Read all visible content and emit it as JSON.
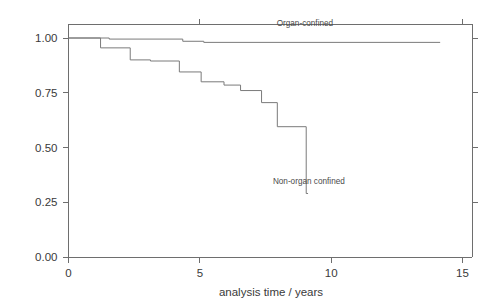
{
  "chart_data": {
    "type": "line",
    "subtype": "kaplan-meier-step",
    "title": "",
    "xlabel": "analysis time / years",
    "ylabel": "",
    "xlim": [
      -0.35,
      15.6
    ],
    "ylim": [
      -0.06,
      1.09
    ],
    "grid": false,
    "legend_position": "inline-annotation",
    "xticks": [
      0,
      5,
      10,
      15
    ],
    "xticklabels": [
      "0",
      "5",
      "10",
      "15"
    ],
    "yticks": [
      0.0,
      0.25,
      0.5,
      0.75,
      1.0
    ],
    "yticklabels": [
      "0.00",
      "0.25",
      "0.50",
      "0.75",
      "1.00"
    ],
    "series": [
      {
        "name": "Organ-confined",
        "label": "Organ-confined",
        "label_x": 9.0,
        "label_y": 1.055,
        "x": [
          0.0,
          1.55,
          1.55,
          4.35,
          4.35,
          5.15,
          5.15,
          14.15
        ],
        "y": [
          1.0,
          1.0,
          0.995,
          0.995,
          0.985,
          0.985,
          0.98,
          0.98
        ],
        "points": [
          {
            "t": 0.0,
            "s": 1.0
          },
          {
            "t": 1.55,
            "s": 0.995
          },
          {
            "t": 4.35,
            "s": 0.985
          },
          {
            "t": 5.15,
            "s": 0.98
          },
          {
            "t": 14.15,
            "s": 0.98
          }
        ]
      },
      {
        "name": "Non-organ confined",
        "label": "Non-organ confined",
        "label_x": 9.15,
        "label_y": 0.335,
        "x": [
          0.0,
          1.22,
          1.22,
          2.35,
          2.35,
          3.12,
          3.12,
          4.22,
          4.22,
          5.05,
          5.05,
          5.92,
          5.92,
          6.55,
          6.55,
          7.35,
          7.35,
          7.95,
          7.95,
          9.05,
          9.05,
          9.12
        ],
        "y": [
          1.0,
          1.0,
          0.955,
          0.955,
          0.9,
          0.9,
          0.895,
          0.895,
          0.845,
          0.845,
          0.8,
          0.8,
          0.785,
          0.785,
          0.76,
          0.76,
          0.705,
          0.705,
          0.595,
          0.595,
          0.29,
          0.29
        ],
        "points": [
          {
            "t": 0.0,
            "s": 1.0
          },
          {
            "t": 1.22,
            "s": 0.955
          },
          {
            "t": 2.35,
            "s": 0.9
          },
          {
            "t": 3.12,
            "s": 0.895
          },
          {
            "t": 4.22,
            "s": 0.845
          },
          {
            "t": 5.05,
            "s": 0.8
          },
          {
            "t": 5.92,
            "s": 0.785
          },
          {
            "t": 6.55,
            "s": 0.76
          },
          {
            "t": 7.35,
            "s": 0.705
          },
          {
            "t": 7.95,
            "s": 0.595
          },
          {
            "t": 9.05,
            "s": 0.29
          },
          {
            "t": 9.12,
            "s": 0.29
          }
        ]
      }
    ]
  },
  "colors": {
    "axis": "#6e6e6e",
    "curve": "#7a7a7a",
    "text": "#3a3a3a",
    "background": "#ffffff"
  }
}
